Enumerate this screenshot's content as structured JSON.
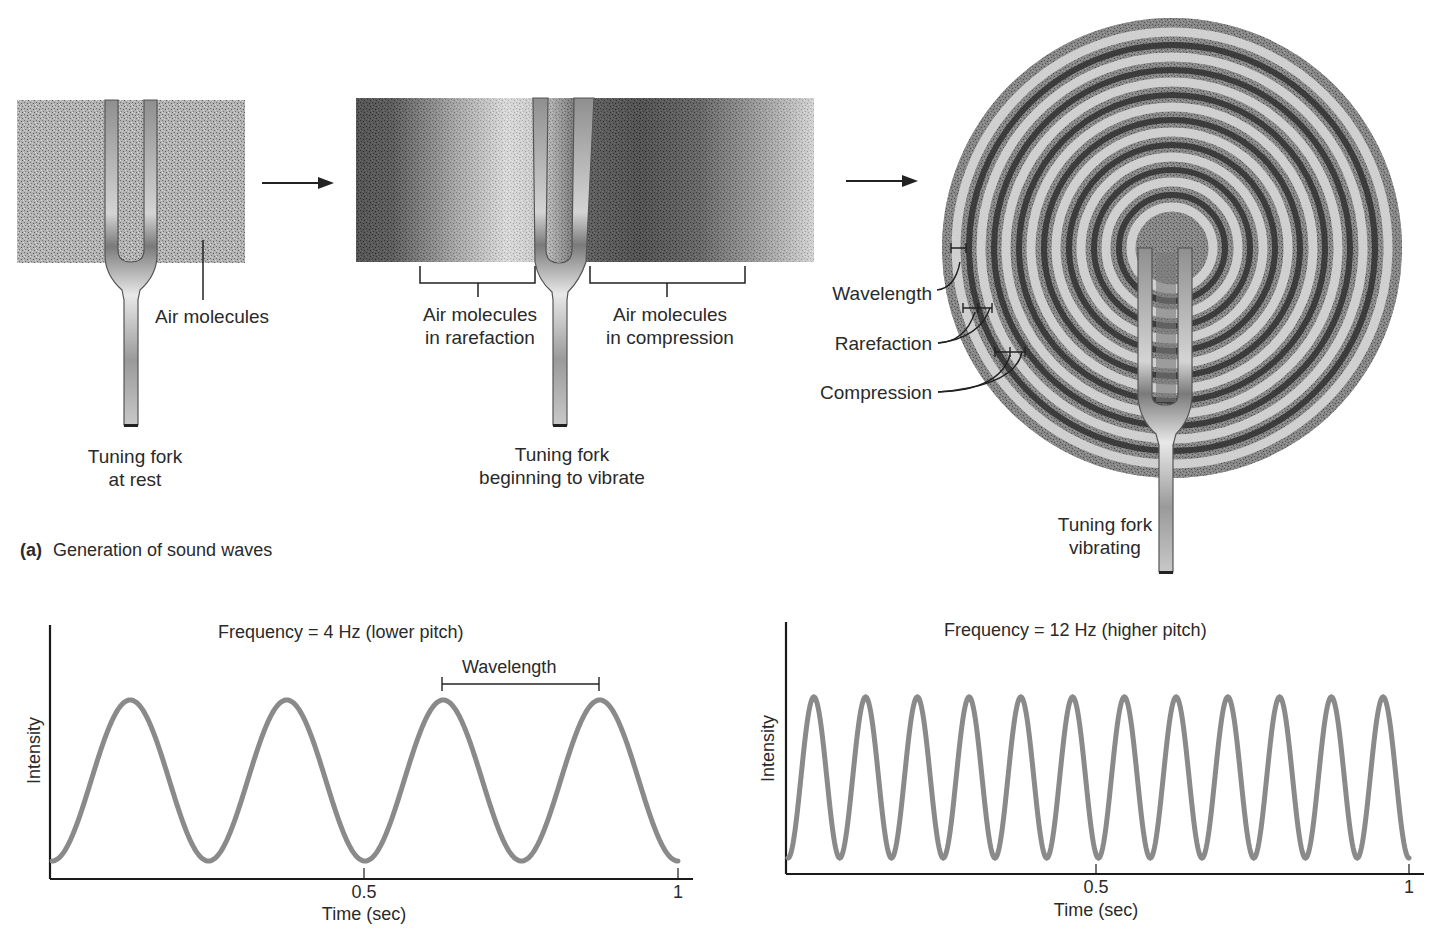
{
  "panel_a": {
    "caption_letter": "(a)",
    "caption_text": "Generation of sound waves",
    "stage1": {
      "pointer_label": "Air molecules",
      "fork_label_line1": "Tuning fork",
      "fork_label_line2": "at rest"
    },
    "stage2": {
      "left_bracket_line1": "Air molecules",
      "left_bracket_line2": "in rarefaction",
      "right_bracket_line1": "Air molecules",
      "right_bracket_line2": "in compression",
      "fork_label_line1": "Tuning fork",
      "fork_label_line2": "beginning to vibrate"
    },
    "stage3": {
      "wavelength_label": "Wavelength",
      "rarefaction_label": "Rarefaction",
      "compression_label": "Compression",
      "fork_label_line1": "Tuning fork",
      "fork_label_line2": "vibrating"
    }
  },
  "chart_data": [
    {
      "type": "line",
      "title": "Frequency = 4 Hz (lower pitch)",
      "xlabel": "Time (sec)",
      "ylabel": "Intensity",
      "xlim": [
        0,
        1
      ],
      "x_ticks": [
        "0.5",
        "1"
      ],
      "frequency_hz": 4,
      "annotation": "Wavelength",
      "series": [
        {
          "name": "4 Hz wave",
          "function": "intensity = (1 - cos(2*pi*4*t))/2",
          "color": "#8a8a8a",
          "x": [
            0,
            0.125,
            0.25,
            0.375,
            0.5,
            0.625,
            0.75,
            0.875,
            1
          ],
          "values": [
            0,
            1,
            0,
            1,
            0,
            1,
            0,
            1,
            0
          ]
        }
      ],
      "grid": false
    },
    {
      "type": "line",
      "title": "Frequency = 12 Hz (higher pitch)",
      "xlabel": "Time (sec)",
      "ylabel": "Intensity",
      "xlim": [
        0,
        1
      ],
      "x_ticks": [
        "0.5",
        "1"
      ],
      "frequency_hz": 12,
      "series": [
        {
          "name": "12 Hz wave",
          "function": "intensity = (1 - cos(2*pi*12*t))/2",
          "color": "#8a8a8a",
          "x": [
            0,
            0.0417,
            0.0833,
            0.125,
            0.1667,
            0.2083,
            0.25,
            0.2917,
            0.3333,
            0.375,
            0.4167,
            0.4583,
            0.5,
            0.5417,
            0.5833,
            0.625,
            0.6667,
            0.7083,
            0.75,
            0.7917,
            0.8333,
            0.875,
            0.9167,
            0.9583,
            1
          ],
          "values": [
            0,
            1,
            0,
            1,
            0,
            1,
            0,
            1,
            0,
            1,
            0,
            1,
            0,
            1,
            0,
            1,
            0,
            1,
            0,
            1,
            0,
            1,
            0,
            1,
            0
          ]
        }
      ],
      "grid": false
    }
  ],
  "charts": {
    "left": {
      "title": "Frequency = 4 Hz (lower pitch)",
      "annotation": "Wavelength",
      "ylabel": "Intensity",
      "xlabel": "Time (sec)",
      "tick_mid": "0.5",
      "tick_end": "1"
    },
    "right": {
      "title": "Frequency = 12 Hz (higher pitch)",
      "ylabel": "Intensity",
      "xlabel": "Time (sec)",
      "tick_mid": "0.5",
      "tick_end": "1"
    }
  },
  "colors": {
    "wave": "#8a8a8a",
    "ink": "#2a2a2a",
    "fork": "#b8b8b8"
  }
}
